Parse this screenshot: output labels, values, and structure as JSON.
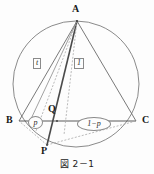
{
  "figure": {
    "caption": "図 2－1",
    "vertices": {
      "a": "A",
      "b": "B",
      "c": "C",
      "p": "P",
      "q": "Q"
    },
    "annotations": {
      "box_left": "t",
      "box_right": "1",
      "oval_p": "p",
      "oval_one_minus_p": "1−p"
    },
    "colors": {
      "stroke": "#555555",
      "stroke_light": "#9a9a9a",
      "stroke_dashed": "#a8a8a8",
      "text": "#1a1a1a",
      "background": "#fdfdfd"
    },
    "geometry": {
      "circle": {
        "cx": 76,
        "cy": 84,
        "r": 63
      },
      "points": {
        "A": {
          "x": 77,
          "y": 21
        },
        "B": {
          "x": 19,
          "y": 121
        },
        "C": {
          "x": 136,
          "y": 121
        },
        "P": {
          "x": 47,
          "y": 145
        },
        "Q": {
          "x": 57,
          "y": 121
        }
      }
    }
  }
}
